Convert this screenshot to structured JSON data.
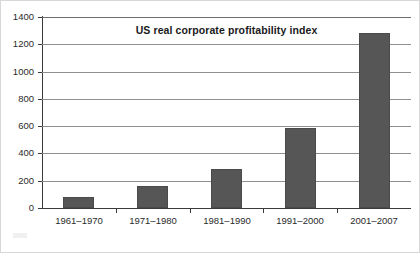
{
  "chart_data": {
    "type": "bar",
    "title": "US real corporate profitability index",
    "xlabel": "",
    "ylabel": "",
    "categories": [
      "1961–1970",
      "1971–1980",
      "1981–1990",
      "1991–2000",
      "2001–2007"
    ],
    "values": [
      80,
      160,
      288,
      585,
      1280
    ],
    "ylim": [
      0,
      1400
    ],
    "ytick_labels": [
      "0",
      "200",
      "400",
      "600",
      "800",
      "1000",
      "1200",
      "1400"
    ],
    "ytick_values": [
      0,
      200,
      400,
      600,
      800,
      1000,
      1200,
      1400
    ],
    "grid": "horizontal",
    "legend": "none",
    "bar_color": "#565656",
    "gridline_color": "#8f8f8f",
    "axis_color": "#3a3a3a",
    "text_color": "#2b2b2b"
  }
}
